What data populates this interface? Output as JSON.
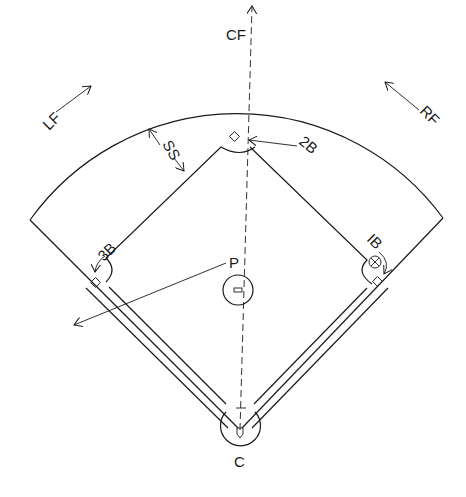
{
  "diagram": {
    "type": "baseball-field-positions",
    "labels": {
      "center_field": "CF",
      "left_field": "LF",
      "right_field": "RF",
      "shortstop": "SS",
      "second_base": "2B",
      "third_base": "3B",
      "first_base": "IB",
      "pitcher": "P",
      "catcher": "C"
    },
    "colors": {
      "line": "#1a1a1a",
      "background": "#ffffff"
    }
  }
}
